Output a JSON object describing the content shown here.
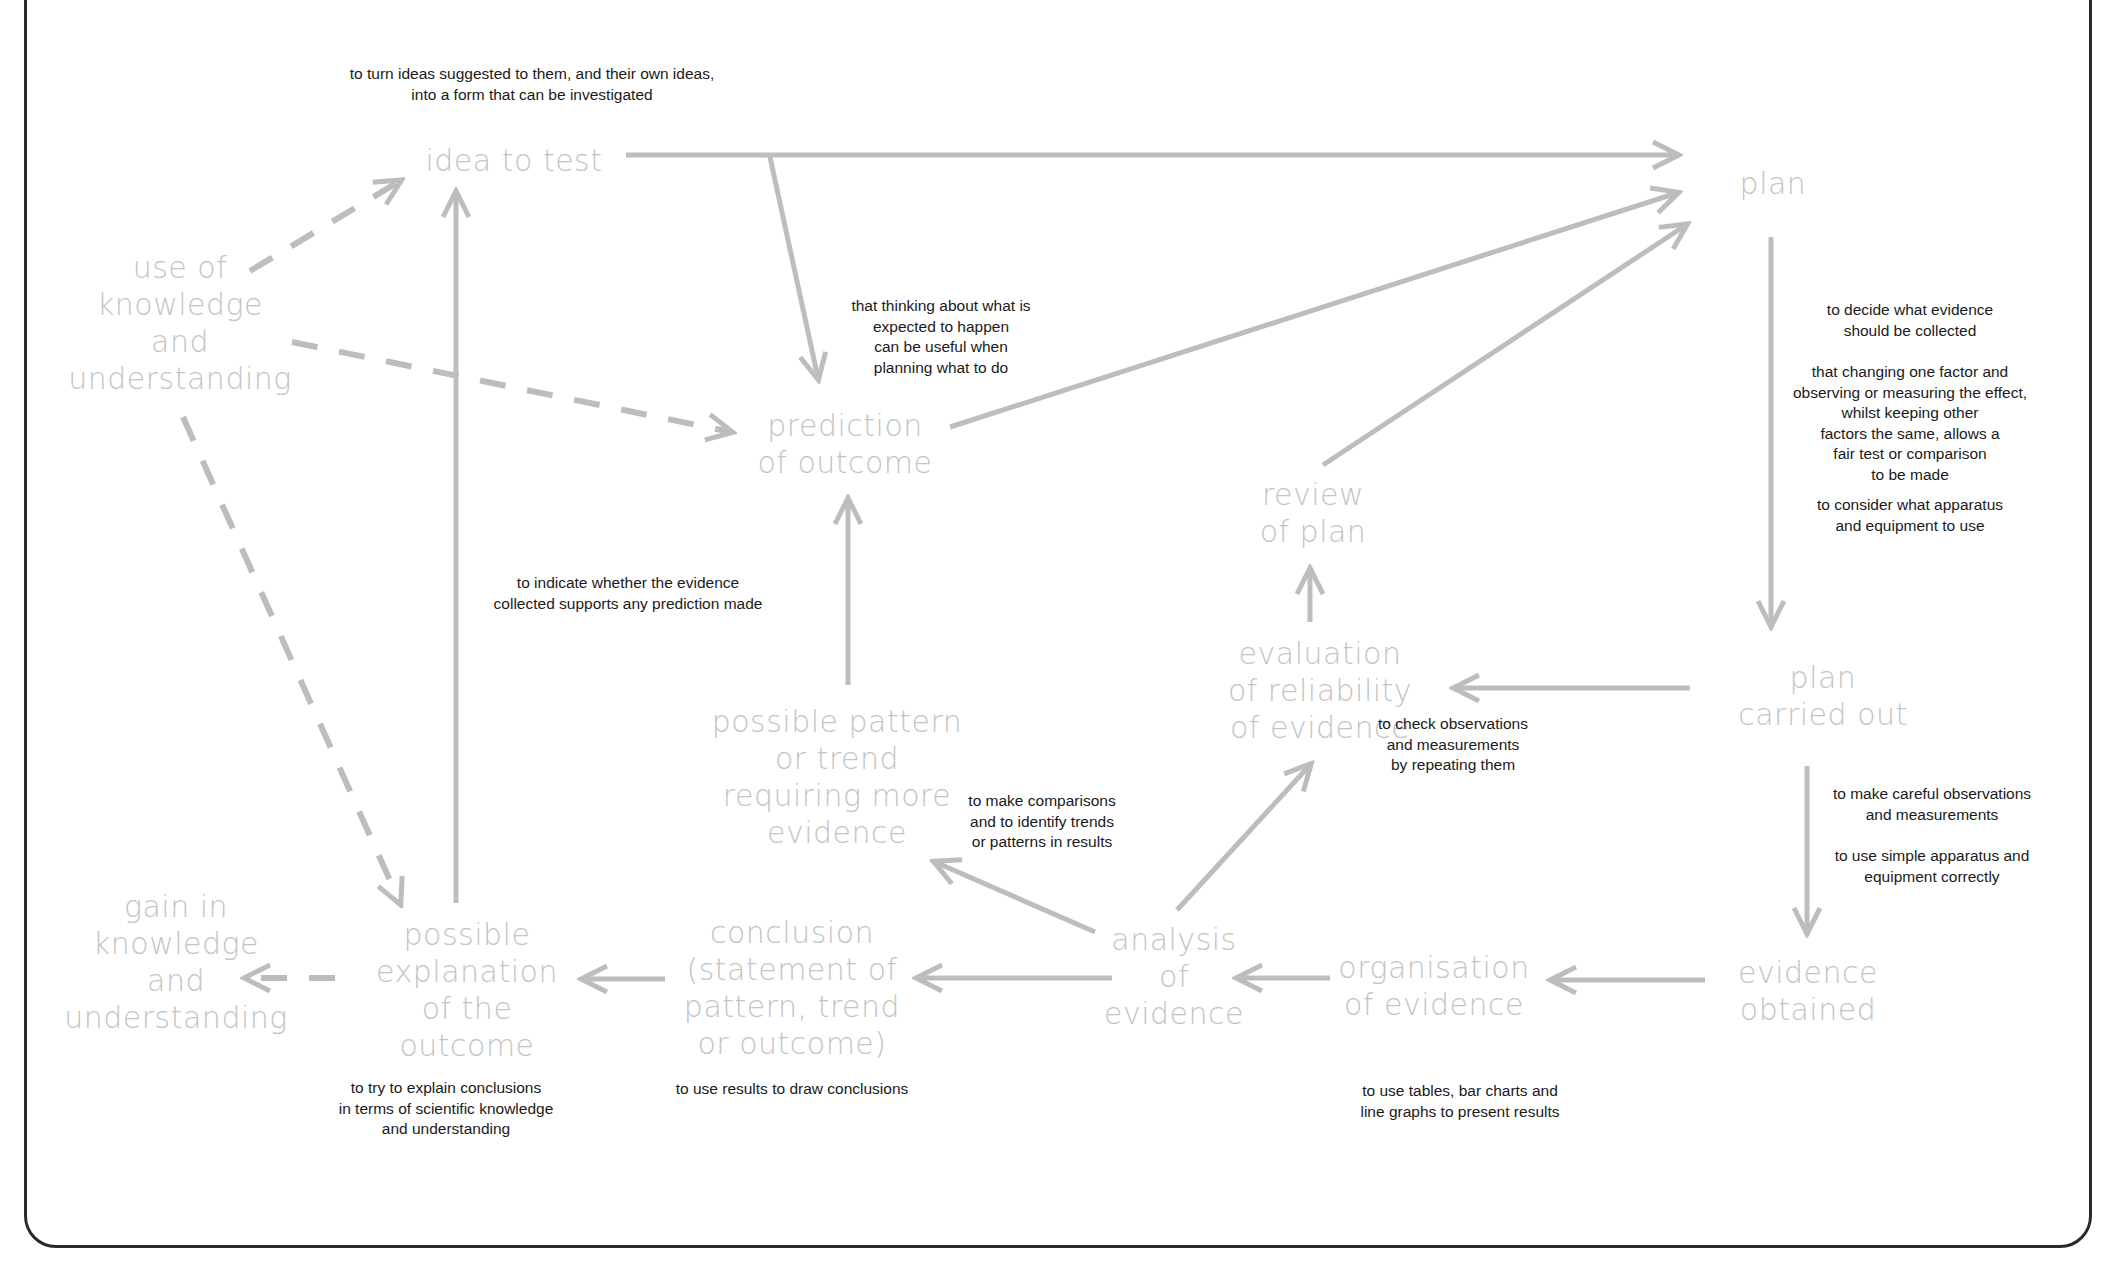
{
  "nodes": {
    "idea_to_test": [
      "idea to test"
    ],
    "plan": [
      "plan"
    ],
    "use_of_knowledge": [
      "use of",
      "knowledge",
      "and",
      "understanding"
    ],
    "prediction": [
      "prediction",
      "of outcome"
    ],
    "review_of_plan": [
      "review",
      "of plan"
    ],
    "evaluation": [
      "evaluation",
      "of reliability",
      "of evidence"
    ],
    "plan_carried_out": [
      "plan",
      "carried out"
    ],
    "possible_pattern": [
      "possible pattern",
      "or trend",
      "requiring more",
      "evidence"
    ],
    "gain_in_knowledge": [
      "gain in",
      "knowledge",
      "and",
      "understanding"
    ],
    "possible_explanation": [
      "possible",
      "explanation",
      "of the",
      "outcome"
    ],
    "conclusion": [
      "conclusion",
      "(statement of",
      "pattern, trend",
      "or outcome)"
    ],
    "analysis": [
      "analysis",
      "of",
      "evidence"
    ],
    "organisation": [
      "organisation",
      "of evidence"
    ],
    "evidence_obtained": [
      "evidence",
      "obtained"
    ]
  },
  "notes": {
    "idea": [
      "to turn ideas suggested to them, and their own ideas,",
      "into a form that can be investigated"
    ],
    "prediction_thinking": [
      "that thinking about what is",
      "expected to happen",
      "can be useful when",
      "planning what to do"
    ],
    "plan_decide": [
      "to decide what evidence",
      "should be collected"
    ],
    "plan_fair_test": [
      "that changing one factor and",
      "observing or measuring the effect,",
      "whilst keeping other",
      "factors the same, allows a",
      "fair test or comparison",
      "to be made"
    ],
    "plan_apparatus": [
      "to consider what apparatus",
      "and equipment to use"
    ],
    "indicate": [
      "to indicate whether the evidence",
      "collected supports any prediction made"
    ],
    "check": [
      "to check observations",
      "and measurements",
      "by repeating them"
    ],
    "careful": [
      "to make careful observations",
      "and measurements"
    ],
    "simple_apparatus": [
      "to use simple apparatus and",
      "equipment correctly"
    ],
    "comparisons": [
      "to make comparisons",
      "and to identify trends",
      "or patterns in results"
    ],
    "explain": [
      "to try to explain conclusions",
      "in terms of scientific knowledge",
      "and understanding"
    ],
    "draw_conclusions": [
      "to use results to draw conclusions"
    ],
    "tables": [
      "to use tables, bar charts and",
      "line graphs to present results"
    ]
  },
  "colors": {
    "node_text": "#c4c4c4",
    "note_text": "#1a1a1a",
    "arrow": "#bdbdbd",
    "frame": "#2a2a2a"
  }
}
